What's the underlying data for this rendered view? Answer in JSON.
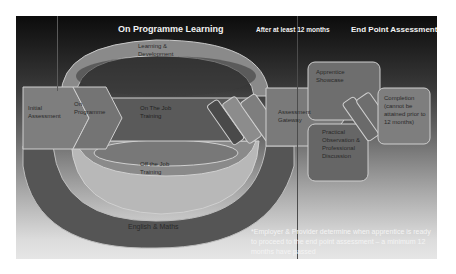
{
  "headers": {
    "on_programme": "On Programme Learning",
    "after_months": "After at least 12 months",
    "end_point": "End Point Assessment"
  },
  "stages": {
    "initial_assessment": "Initial Assessment",
    "on_programme": "On Programme",
    "on_the_job": "On The Job Training",
    "learning_development": "Learning & Development",
    "off_the_job": "Off the Job Training",
    "english_maths": "English & Maths",
    "assessment_gateway": "Assessment Gateway",
    "apprentice_showcase": "Apprentice Showcase",
    "practical_observation": "Practical Observation & Professional Discussion",
    "completion": "Completion (cannot be attained prior to 12 months)"
  },
  "note": "*Employer & Provider determine when apprentice is ready to proceed to the end point assessment – a minimum 12 months have passed",
  "colors": {
    "band_dark": "#4a4a4a",
    "band_mid": "#7a7a7a",
    "band_light": "#9a9a9a",
    "outline": "#c8c8c8"
  }
}
